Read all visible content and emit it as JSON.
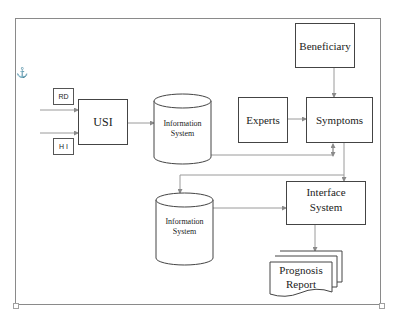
{
  "diagram": {
    "nodes": {
      "rd": "RD",
      "hi": "H I",
      "usi": "USI",
      "info_system_1": [
        "Information",
        "System"
      ],
      "experts": "Experts",
      "beneficiary": "Beneficiary",
      "symptoms": "Symptoms",
      "info_system_2": [
        "Information",
        "System"
      ],
      "interface_system": [
        "Interface",
        "System"
      ],
      "prognosis_report": [
        "Prognosis",
        "Report"
      ]
    },
    "anchor_icon": "⚓",
    "edges": [
      {
        "from": "RD",
        "to": "USI"
      },
      {
        "from": "H I",
        "to": "USI"
      },
      {
        "from": "USI",
        "to": "Information System (1)"
      },
      {
        "from": "Information System (1)",
        "to": "Symptoms",
        "bidirectional": true
      },
      {
        "from": "Experts",
        "to": "Symptoms"
      },
      {
        "from": "Beneficiary",
        "to": "Symptoms"
      },
      {
        "from": "Symptoms",
        "to": "Information System (2)"
      },
      {
        "from": "Symptoms",
        "to": "Interface System"
      },
      {
        "from": "Information System (2)",
        "to": "Interface System"
      },
      {
        "from": "Interface System",
        "to": "Prognosis Report"
      }
    ],
    "colors": {
      "line": "#8a8a8a",
      "border": "#444444",
      "text": "#222222"
    }
  }
}
